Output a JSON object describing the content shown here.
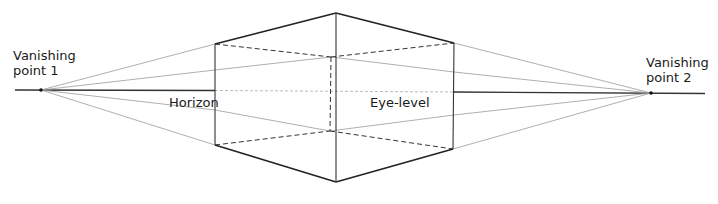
{
  "diagram": {
    "labels": {
      "vp1_line1": "Vanishing",
      "vp1_line2": "point 1",
      "vp2_line1": "Vanishing",
      "vp2_line2": "point 2",
      "horizon": "Horizon",
      "eye_level": "Eye-level"
    },
    "points": {
      "vp1": [
        41,
        90
      ],
      "vp2": [
        651,
        93
      ],
      "front_top": [
        336,
        13
      ],
      "front_bottom": [
        336,
        182
      ],
      "left_top": [
        215,
        44
      ],
      "left_bottom": [
        215,
        145
      ],
      "right_top": [
        454,
        43
      ],
      "right_bottom": [
        453,
        149
      ],
      "back_top": [
        331,
        57
      ],
      "back_bottom": [
        330,
        131
      ]
    },
    "colors": {
      "ink": "#222222",
      "construction": "#9a9a9a",
      "background": "#ffffff"
    }
  }
}
